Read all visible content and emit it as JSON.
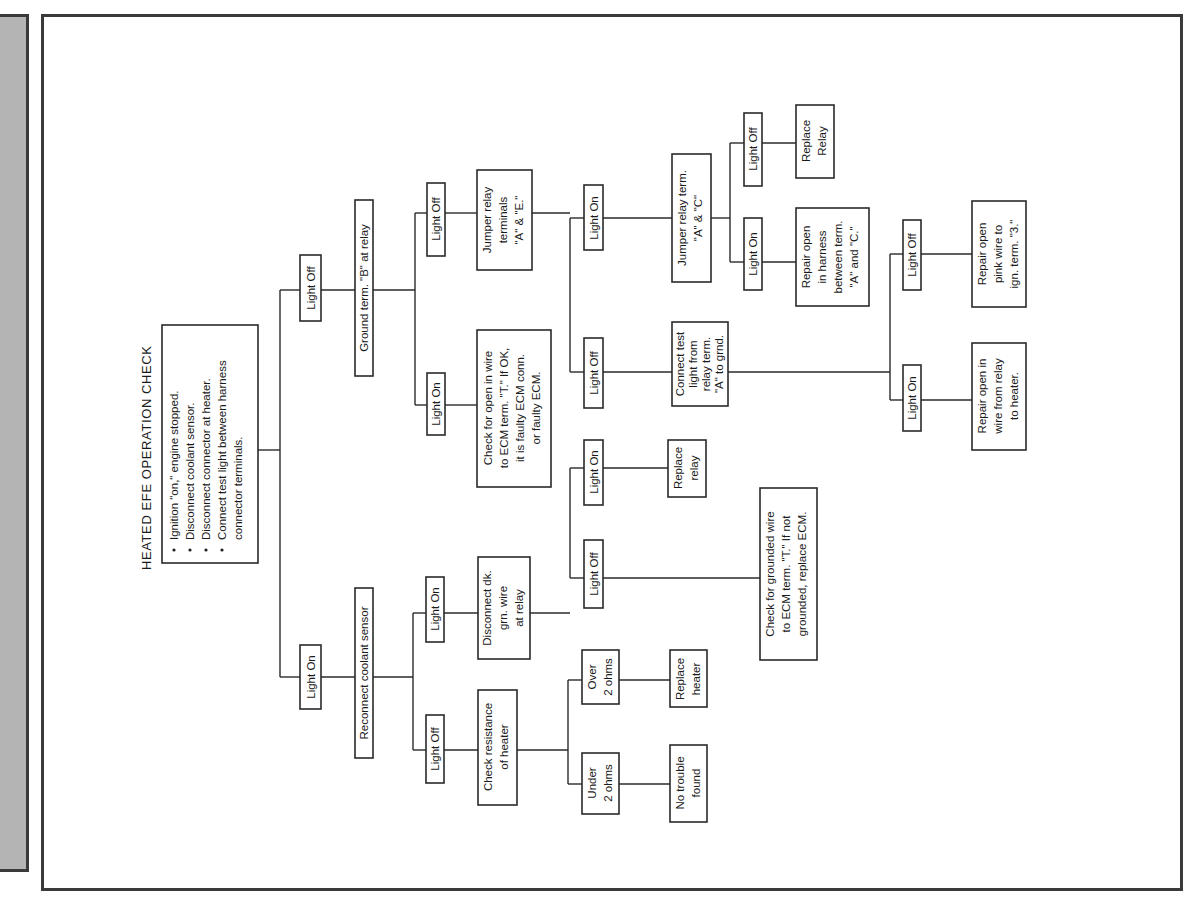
{
  "title": "HEATED EFE OPERATION CHECK",
  "instructions": [
    "Ignition \"on,\" engine stopped.",
    "Disconnect coolant sensor.",
    "Disconnect connector at heater.",
    "Connect test light between harness",
    "connector terminals."
  ],
  "nodes": {
    "root_off": "Light Off",
    "root_on": "Light On",
    "ground_b": "Ground term. \"B\" at relay",
    "gb_on": "Light On",
    "gb_off": "Light Off",
    "check_open_ecm": [
      "Check for open in wire",
      "to ECM term. \"T.\" If OK,",
      "it is faulty ECM conn.",
      "or faulty ECM."
    ],
    "jumper_ae": [
      "Jumper relay",
      "terminals",
      "\"A\" & \"E.\""
    ],
    "jae_on": "Light On",
    "jae_off": "Light Off",
    "jumper_ac": [
      "Jumper relay term.",
      "\"A\" & \"C\""
    ],
    "jac_off": "Light Off",
    "jac_on": "Light On",
    "replace_relay_top": [
      "Replace",
      "Relay"
    ],
    "repair_harness_ac": [
      "Repair open",
      "in harness",
      "between term.",
      "\"A\" and \"C.\""
    ],
    "connect_test_light": [
      "Connect test",
      "light from",
      "relay term.",
      "\"A\" to grnd."
    ],
    "ctl_on": "Light On",
    "ctl_off": "Light Off",
    "repair_relay_heater": [
      "Repair open in",
      "wire from relay",
      "to heater."
    ],
    "repair_pink": [
      "Repair open",
      "pink wire to",
      "ign. term. \"3.\""
    ],
    "reconnect_coolant": "Reconnect coolant sensor",
    "rc_on": "Light On",
    "rc_off": "Light Off",
    "disconnect_dk_grn": [
      "Disconnect dk.",
      "grn. wire",
      "at relay"
    ],
    "ddg_on": "Light On",
    "ddg_off": "Light Off",
    "replace_relay_low": [
      "Replace",
      "relay"
    ],
    "check_grounded_ecm": [
      "Check for grounded wire",
      "to ECM term. \"T.\" If not",
      "grounded, replace ECM."
    ],
    "check_resistance": [
      "Check resistance",
      "of heater"
    ],
    "over_2": [
      "Over",
      "2 ohms"
    ],
    "under_2": [
      "Under",
      "2 ohms"
    ],
    "replace_heater": [
      "Replace",
      "heater"
    ],
    "no_trouble": [
      "No trouble",
      "found"
    ]
  },
  "colors": {
    "ink": "#2a2a2a",
    "panel": "#b4b4b4",
    "frame": "#3a3a3a"
  }
}
